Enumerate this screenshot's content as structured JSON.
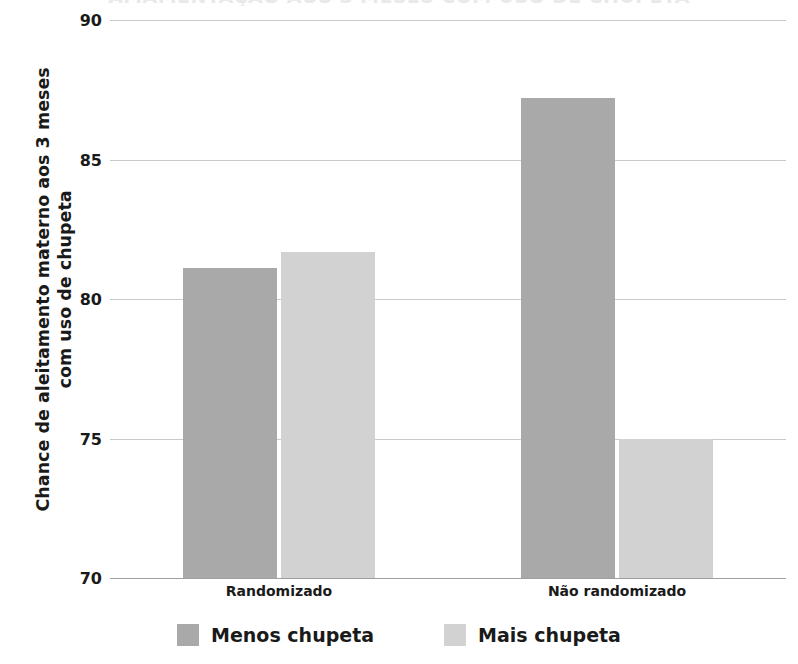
{
  "chart_data": {
    "type": "bar",
    "title": "AMAMENTAÇÃO AOS 3 MESES COM USO DE CHUPETA",
    "title_visible_note": "clipped at top edge",
    "xlabel": "",
    "ylabel": "Chance de aleitamento materno aos 3 meses com uso de chupeta",
    "ylabel_line1": "Chance de aleitamento materno aos 3 meses",
    "ylabel_line2": "com uso de chupeta",
    "categories": [
      "Randomizado",
      "Não randomizado"
    ],
    "series": [
      {
        "name": "Menos chupeta",
        "color": "#a9a9a9",
        "values": [
          81.1,
          87.2
        ]
      },
      {
        "name": "Mais chupeta",
        "color": "#d2d2d2",
        "values": [
          81.7,
          75.0
        ]
      }
    ],
    "ylim": [
      70,
      90
    ],
    "yticks": [
      70,
      75,
      80,
      85,
      90
    ],
    "ytick_labels": [
      "70",
      "75",
      "80",
      "85",
      "90"
    ],
    "grid": true,
    "legend_position": "bottom"
  },
  "legend": {
    "items": [
      {
        "label": "Menos chupeta"
      },
      {
        "label": "Mais chupeta"
      }
    ]
  }
}
